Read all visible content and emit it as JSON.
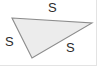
{
  "figure": {
    "kind": "geometry-diagram",
    "shape": "triangle",
    "fill_color": "#ececec",
    "stroke_color": "#8c8c8c",
    "stroke_width": 1.1,
    "label_color": "#2b2b2b",
    "background_color": "#ffffff",
    "frame_color": "#e3e3e3",
    "vertices": [
      {
        "name": "left-vertex",
        "x": 12,
        "y": 18
      },
      {
        "name": "right-vertex",
        "x": 92,
        "y": 23
      },
      {
        "name": "bottom-vertex",
        "x": 32,
        "y": 58
      }
    ],
    "polygon_points": "12,18 92,23 32,58",
    "labels": [
      {
        "id": "top",
        "text": "S",
        "x": 53,
        "y": 8
      },
      {
        "id": "left",
        "text": "S",
        "x": 9,
        "y": 42
      },
      {
        "id": "bottom_right",
        "text": "S",
        "x": 70,
        "y": 48
      }
    ]
  },
  "chart_data": {
    "type": "diagram",
    "title": "",
    "categories": [
      "top side",
      "left side",
      "bottom-right side"
    ],
    "values": [
      "S",
      "S",
      "S"
    ]
  }
}
